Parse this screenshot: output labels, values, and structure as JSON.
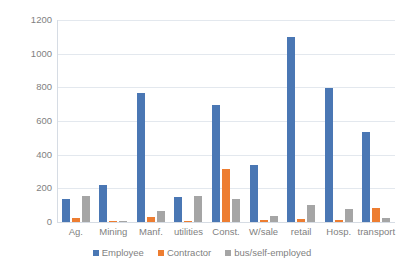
{
  "chart_data": {
    "type": "bar",
    "title": "",
    "subtitle": "",
    "xlabel": "",
    "ylabel": "",
    "ylim": [
      0,
      1200
    ],
    "ytick_labels": [
      "1200",
      "1000",
      "800",
      "600",
      "400",
      "200",
      "0"
    ],
    "ytick_values": [
      1200,
      1000,
      800,
      600,
      400,
      200,
      0
    ],
    "grid": true,
    "legend_position": "bottom",
    "categories": [
      "Ag.",
      "Mining",
      "Manf.",
      "utilities",
      "Const.",
      "W/sale",
      "retail",
      "Hosp.",
      "transport"
    ],
    "series": [
      {
        "name": "Employee",
        "color": "#4a77b4",
        "values": [
          135,
          222,
          765,
          147,
          698,
          340,
          1100,
          795,
          535
        ]
      },
      {
        "name": "Contractor",
        "color": "#ed7d31",
        "values": [
          22,
          3,
          28,
          3,
          312,
          12,
          20,
          12,
          85
        ]
      },
      {
        "name": "bus/self-employed",
        "color": "#a5a5a5",
        "values": [
          152,
          2,
          65,
          155,
          138,
          38,
          100,
          78,
          25
        ]
      }
    ]
  },
  "legend": {
    "items": [
      {
        "label": "Employee"
      },
      {
        "label": "Contractor"
      },
      {
        "label": "bus/self-employed"
      }
    ]
  },
  "colors": {
    "series_employee": "#4a77b4",
    "series_contractor": "#ed7d31",
    "series_self_employed": "#a5a5a5",
    "gridline": "#e3e8ee",
    "axis": "#d6dce4",
    "tick_text": "#7f7f7f",
    "background": "#ffffff"
  }
}
